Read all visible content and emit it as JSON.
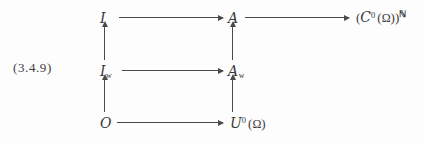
{
  "figure": {
    "equation_tag": "(3.4.9)",
    "background_color": "#fdfdfd",
    "ink_color": "#3a3a3a"
  },
  "nodes": {
    "top_left": {
      "base": "I",
      "subscript": "",
      "label": "I"
    },
    "top_middle": {
      "base": "A",
      "subscript": "",
      "label": "A"
    },
    "top_right": {
      "open": "(",
      "base": "C",
      "superscript": "0",
      "arg_open": "(",
      "omega": "Ω",
      "arg_close": ")",
      "close": ")",
      "power": "ℕ"
    },
    "mid_left": {
      "base": "I",
      "subscript": "w",
      "label": "I_w"
    },
    "mid_middle": {
      "base": "A",
      "subscript": "w",
      "label": "A_w"
    },
    "bottom_left": {
      "base": "O",
      "subscript": "",
      "label": "O"
    },
    "bottom_middle": {
      "base": "U",
      "superscript": "0",
      "arg_open": "(",
      "omega": "Ω",
      "arg_close": ")"
    }
  },
  "arrows": [
    {
      "name": "I-to-A",
      "direction": "right"
    },
    {
      "name": "A-to-CN",
      "direction": "right"
    },
    {
      "name": "Iw-to-Aw",
      "direction": "right"
    },
    {
      "name": "O-to-U0",
      "direction": "right"
    },
    {
      "name": "Iw-to-I",
      "direction": "up"
    },
    {
      "name": "Aw-to-A",
      "direction": "up"
    },
    {
      "name": "O-to-Iw",
      "direction": "up"
    },
    {
      "name": "U0-to-Aw",
      "direction": "up"
    }
  ]
}
